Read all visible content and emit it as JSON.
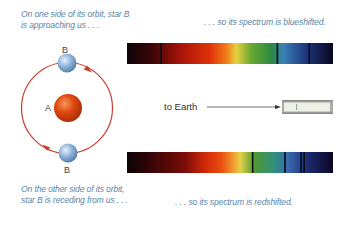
{
  "captions": {
    "top_left_line1": "On one side of its orbit, star B",
    "top_left_line2": "is approaching us . . .",
    "top_right": ". . . so its spectrum is blueshifted.",
    "bottom_left_line1": "On the other side of its orbit,",
    "bottom_left_line2": "star B is receding from us . . .",
    "bottom_right": ". . . so its spectrum is redshifted."
  },
  "labels": {
    "star_a": "A",
    "star_b_top": "B",
    "star_b_bottom": "B",
    "earth": "to Earth"
  },
  "spectra": {
    "blueshifted": {
      "name": "blueshifted spectrum",
      "absorption_line_positions_fraction": [
        0.165,
        0.73,
        0.885
      ]
    },
    "redshifted": {
      "name": "redshifted spectrum",
      "absorption_line_positions_fraction": [
        0.61,
        0.767,
        0.845,
        0.86
      ]
    }
  },
  "colors": {
    "caption": "#5a87a8",
    "orbit": "#c8402a",
    "star_a": "#e04a10",
    "star_b": "#8fb3da"
  }
}
